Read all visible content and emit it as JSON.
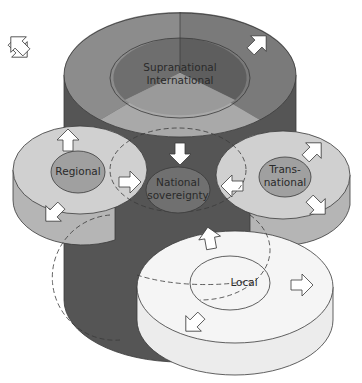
{
  "diagram": {
    "nodes": {
      "supranational": {
        "line1": "Supranational",
        "line2": "International"
      },
      "regional": {
        "label": "Regional"
      },
      "transnational": {
        "line1": "Trans-",
        "line2": "national"
      },
      "national": {
        "line1": "National",
        "line2": "sovereignty"
      },
      "local": {
        "label": "Local"
      }
    },
    "colors": {
      "supra_top_left": "#8c8c8c",
      "supra_top_right": "#7a7a7a",
      "supra_inner_left": "#6e6e6e",
      "supra_inner_right": "#5e5e5e",
      "supra_wall": "#555555",
      "center_wedge": "#a9a9a9",
      "regional_top": "#d0d0d0",
      "regional_wall": "#b5b5b5",
      "regional_inner": "#a0a0a0",
      "trans_top": "#d0d0d0",
      "trans_inner": "#a0a0a0",
      "national_inner": "#707070",
      "local_top": "#f5f5f5",
      "local_wall": "#ececec",
      "arrow_fill": "#ffffff",
      "stroke": "#3a3a3a"
    }
  }
}
